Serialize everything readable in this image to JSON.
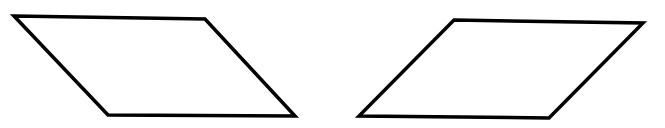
{
  "canvas": {
    "width": 665,
    "height": 128,
    "background": "#ffffff"
  },
  "style": {
    "stroke": "#000000",
    "stroke_width": 3.5,
    "fill": "none"
  },
  "shapes": [
    {
      "name": "parallelogram-left",
      "type": "parallelogram",
      "lean": "left",
      "points": [
        [
          14,
          16
        ],
        [
          205,
          19
        ],
        [
          295,
          116
        ],
        [
          108,
          115
        ]
      ]
    },
    {
      "name": "parallelogram-right",
      "type": "parallelogram",
      "lean": "right",
      "points": [
        [
          454,
          20
        ],
        [
          643,
          23
        ],
        [
          549,
          118
        ],
        [
          359,
          116
        ]
      ]
    }
  ]
}
